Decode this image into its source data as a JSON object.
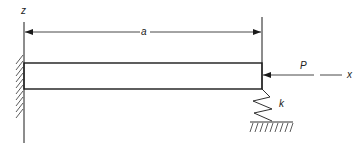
{
  "diagram": {
    "labels": {
      "z_axis": "z",
      "x_axis": "x",
      "length": "a",
      "load": "P",
      "spring": "k"
    },
    "colors": {
      "line": "#1a1a1a",
      "background": "#ffffff"
    }
  }
}
